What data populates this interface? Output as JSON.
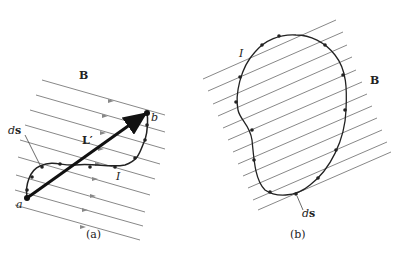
{
  "panel_a": {
    "caption": "(a)",
    "field_label": "B",
    "point_a": "a",
    "point_b": "b",
    "element_label_d": "d",
    "element_label_s": "s",
    "vector_label": "L′",
    "current_label": "I"
  },
  "panel_b": {
    "caption": "(b)",
    "field_label": "B",
    "current_label": "I",
    "element_label_d": "d",
    "element_label_s": "s"
  },
  "colors": {
    "field_lines": "#888888",
    "wire": "#222222"
  }
}
